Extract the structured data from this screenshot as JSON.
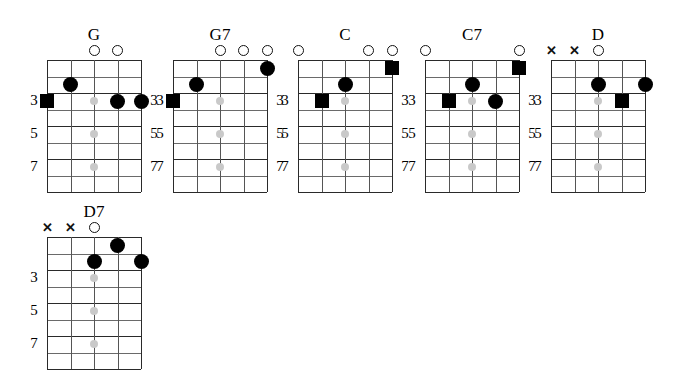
{
  "page": {
    "instrument_strings": 5,
    "frets_shown": 8,
    "background_color": "#ffffff",
    "marker_color": "#000000",
    "inlay_color": "#c9c9c9",
    "grid_line_color": "#2a2a2a"
  },
  "chart_data": {
    "type": "table",
    "xlabel": "strings",
    "ylabel": "frets",
    "string_count": 5,
    "fret_count": 8,
    "fret_labels": [
      "3",
      "5",
      "7"
    ],
    "fret_label_rows": [
      3,
      5,
      7
    ],
    "inlay_string": 3,
    "inlay_frets": [
      3,
      5,
      7
    ],
    "marker_shapes": [
      "circle",
      "square",
      "open",
      "x"
    ],
    "chords": [
      {
        "name": "G",
        "open_strings": [
          3,
          4
        ],
        "muted_strings": [],
        "markers": [
          {
            "string": 2,
            "fret": 2,
            "shape": "circle"
          },
          {
            "string": 1,
            "fret": 3,
            "shape": "square"
          },
          {
            "string": 4,
            "fret": 3,
            "shape": "circle"
          },
          {
            "string": 5,
            "fret": 3,
            "shape": "circle"
          }
        ],
        "fret_numbers_left": [
          "3",
          "5",
          "7"
        ],
        "fret_numbers_right": [
          "3",
          "5",
          "7"
        ]
      },
      {
        "name": "G7",
        "open_strings": [
          3,
          4,
          5
        ],
        "muted_strings": [],
        "markers": [
          {
            "string": 5,
            "fret": 1,
            "shape": "circle"
          },
          {
            "string": 2,
            "fret": 2,
            "shape": "circle"
          },
          {
            "string": 1,
            "fret": 3,
            "shape": "square"
          }
        ],
        "fret_numbers_left": [
          "3",
          "5",
          "7"
        ],
        "fret_numbers_right": [
          "3",
          "5",
          "7"
        ]
      },
      {
        "name": "C",
        "open_strings": [
          1,
          4,
          5
        ],
        "muted_strings": [],
        "markers": [
          {
            "string": 5,
            "fret": 1,
            "shape": "square"
          },
          {
            "string": 3,
            "fret": 2,
            "shape": "circle"
          },
          {
            "string": 2,
            "fret": 3,
            "shape": "square"
          }
        ],
        "fret_numbers_left": [
          "3",
          "5",
          "7"
        ],
        "fret_numbers_right": [
          "3",
          "5",
          "7"
        ]
      },
      {
        "name": "C7",
        "open_strings": [
          1,
          5
        ],
        "muted_strings": [],
        "markers": [
          {
            "string": 5,
            "fret": 1,
            "shape": "square"
          },
          {
            "string": 3,
            "fret": 2,
            "shape": "circle"
          },
          {
            "string": 2,
            "fret": 3,
            "shape": "square"
          },
          {
            "string": 4,
            "fret": 3,
            "shape": "circle"
          }
        ],
        "fret_numbers_left": [
          "3",
          "5",
          "7"
        ],
        "fret_numbers_right": [
          "3",
          "5",
          "7"
        ]
      },
      {
        "name": "D",
        "open_strings": [
          3
        ],
        "muted_strings": [
          1,
          2
        ],
        "markers": [
          {
            "string": 3,
            "fret": 2,
            "shape": "circle"
          },
          {
            "string": 5,
            "fret": 2,
            "shape": "circle"
          },
          {
            "string": 4,
            "fret": 3,
            "shape": "square"
          }
        ],
        "fret_numbers_left": [
          "3",
          "5",
          "7"
        ],
        "fret_numbers_right": []
      },
      {
        "name": "D7",
        "open_strings": [
          3
        ],
        "muted_strings": [
          1,
          2
        ],
        "markers": [
          {
            "string": 4,
            "fret": 1,
            "shape": "circle"
          },
          {
            "string": 3,
            "fret": 2,
            "shape": "circle"
          },
          {
            "string": 5,
            "fret": 2,
            "shape": "circle"
          }
        ],
        "fret_numbers_left": [
          "3",
          "5",
          "7"
        ],
        "fret_numbers_right": []
      }
    ],
    "layout": {
      "rows": [
        {
          "chord_indexes": [
            0,
            1,
            2,
            3,
            4
          ],
          "origin_y": 26
        },
        {
          "chord_indexes": [
            5
          ],
          "origin_y": 203
        }
      ],
      "column_origins_x": [
        47,
        173,
        298,
        425,
        551
      ],
      "grid_width": 94,
      "grid_height": 132
    }
  }
}
